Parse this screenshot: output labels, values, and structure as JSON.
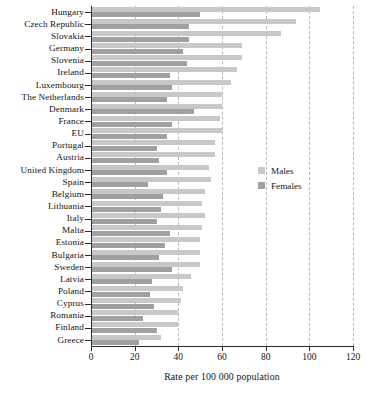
{
  "chart_data": {
    "type": "bar",
    "orientation": "horizontal",
    "title": "",
    "xlabel": "Rate per 100 000 population",
    "ylabel": "",
    "xlim": [
      0,
      120
    ],
    "xticks": [
      0,
      20,
      40,
      60,
      80,
      100,
      120
    ],
    "grid": "vertical-dashed",
    "legend_position": "center-right",
    "categories": [
      "Hungary",
      "Czech Republic",
      "Slovakia",
      "Germany",
      "Slovenia",
      "Ireland",
      "Luxembourg",
      "The Netherlands",
      "Denmark",
      "France",
      "EU",
      "Portugal",
      "Austria",
      "United Kingdom",
      "Spain",
      "Belgium",
      "Lithuania",
      "Italy",
      "Malta",
      "Estonia",
      "Bulgaria",
      "Sweden",
      "Latvia",
      "Poland",
      "Cyprus",
      "Romania",
      "Finland",
      "Greece"
    ],
    "series": [
      {
        "name": "Males",
        "color": "#c8c8c8",
        "values": [
          105,
          94,
          87,
          69,
          69,
          67,
          64,
          60,
          60,
          59,
          60,
          57,
          57,
          54,
          55,
          52,
          51,
          52,
          51,
          50,
          50,
          50,
          46,
          42,
          41,
          40,
          40,
          32
        ]
      },
      {
        "name": "Females",
        "color": "#a0a0a0",
        "values": [
          50,
          45,
          45,
          42,
          44,
          36,
          37,
          35,
          47,
          37,
          35,
          30,
          31,
          35,
          26,
          33,
          32,
          30,
          36,
          34,
          31,
          37,
          28,
          27,
          29,
          24,
          30,
          22
        ]
      }
    ]
  },
  "legend": {
    "items": [
      {
        "label": "Males",
        "color": "#c8c8c8"
      },
      {
        "label": "Females",
        "color": "#a0a0a0"
      }
    ]
  },
  "axis": {
    "x_title": "Rate per 100 000 population",
    "x_tick_labels": [
      "0",
      "20",
      "40",
      "60",
      "80",
      "100",
      "120"
    ]
  }
}
